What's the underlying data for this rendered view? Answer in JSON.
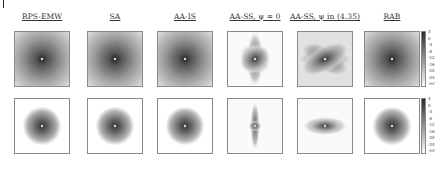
{
  "figure": {
    "columns": [
      {
        "title": "RPS-EMW",
        "pattern": "radial"
      },
      {
        "title": "SA",
        "pattern": "radial"
      },
      {
        "title": "AA-IS",
        "pattern": "radial"
      },
      {
        "title": "AA-SS, ψ = 0",
        "pattern": "cross-vertical"
      },
      {
        "title": "AA-SS, ψ in (4.35)",
        "pattern": "cross-horizontal"
      },
      {
        "title": "RAB",
        "pattern": "radial"
      }
    ],
    "rows": [
      {
        "name": "row-1",
        "spread": "wide"
      },
      {
        "name": "row-2",
        "spread": "narrow"
      }
    ],
    "colorbar": {
      "ticks": [
        "4",
        "0",
        "-4",
        "-8",
        "-12",
        "-16",
        "-20",
        "-24",
        "-Inf"
      ],
      "colormap": "gray"
    }
  }
}
